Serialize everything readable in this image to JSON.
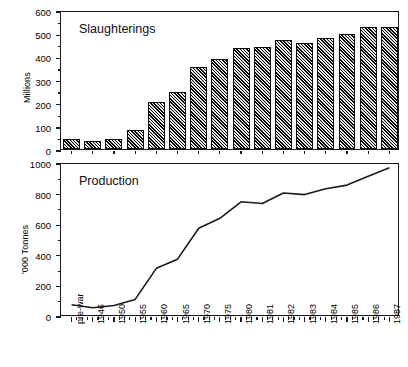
{
  "chart_data": [
    {
      "type": "bar",
      "title": "Slaughterings",
      "xlabel": "",
      "ylabel": "Millions",
      "ylim": [
        0,
        600
      ],
      "ytick_major": [
        0,
        100,
        200,
        300,
        400,
        500,
        600
      ],
      "ytick_minor": [
        50,
        150,
        250,
        350,
        450,
        550
      ],
      "grid": false,
      "legend": "none",
      "categories": [
        "pre-war",
        "1946",
        "1950",
        "1955",
        "1960",
        "1965",
        "1970",
        "1975",
        "1980",
        "1981",
        "1982",
        "1983",
        "1984",
        "1985",
        "1986",
        "1987"
      ],
      "values": [
        45,
        35,
        45,
        80,
        205,
        248,
        352,
        390,
        435,
        440,
        470,
        457,
        478,
        495,
        525,
        525
      ]
    },
    {
      "type": "line",
      "title": "Production",
      "xlabel": "",
      "ylabel": "'000 Tonnes",
      "ylim": [
        0,
        1000
      ],
      "ytick_major": [
        0,
        200,
        400,
        600,
        800,
        1000
      ],
      "ytick_minor": [
        100,
        300,
        500,
        700,
        900
      ],
      "grid": false,
      "legend": "none",
      "categories": [
        "pre-war",
        "1946",
        "1950",
        "1955",
        "1960",
        "1965",
        "1970",
        "1975",
        "1980",
        "1981",
        "1982",
        "1983",
        "1984",
        "1985",
        "1986",
        "1987"
      ],
      "values": [
        80,
        60,
        75,
        115,
        318,
        378,
        580,
        645,
        753,
        742,
        810,
        800,
        838,
        862,
        920,
        975
      ]
    }
  ],
  "figure": {
    "top_panel_title": "Slaughterings",
    "bottom_panel_title": "Production",
    "top_axis_label": "Millions",
    "bottom_axis_label": "'000 Tonnes"
  },
  "colors": {
    "line": "#1a1a1a",
    "axis": "#1a1a1a",
    "bar_fill": "#2a2a2a",
    "bar_edge": "#0a0a0a",
    "background": "#ffffff"
  }
}
